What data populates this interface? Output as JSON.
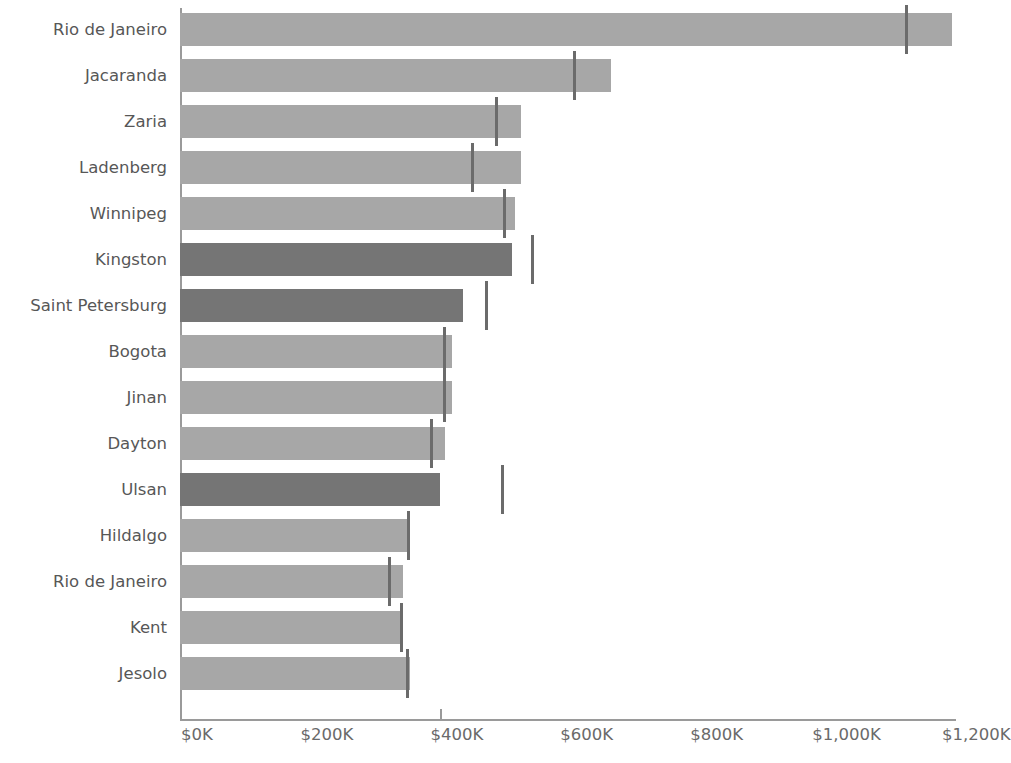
{
  "chart_data": {
    "type": "bar",
    "orientation": "horizontal",
    "title": "",
    "xlabel": "",
    "ylabel": "",
    "xlim": [
      0,
      1250
    ],
    "grid": false,
    "legend": false,
    "value_unit": "K",
    "value_prefix": "$",
    "x_ticks": [
      {
        "label": "$0K",
        "value": 0
      },
      {
        "label": "$200K",
        "value": 200
      },
      {
        "label": "$400K",
        "value": 400
      },
      {
        "label": "$600K",
        "value": 600
      },
      {
        "label": "$800K",
        "value": 800
      },
      {
        "label": "$1,000K",
        "value": 1000
      },
      {
        "label": "$1,200K",
        "value": 1200
      }
    ],
    "categories": [
      "Rio de Janeiro",
      "Jacaranda",
      "Zaria",
      "Ladenberg",
      "Winnipeg",
      "Kingston",
      "Saint Petersburg",
      "Bogota",
      "Jinan",
      "Dayton",
      "Ulsan",
      "Hildalgo",
      "Rio de Janeiro",
      "Kent",
      "Jesolo"
    ],
    "values": [
      1188,
      663,
      525,
      525,
      516,
      511,
      436,
      419,
      419,
      408,
      400,
      351,
      343,
      338,
      354
    ],
    "reference_values": [
      1117,
      605,
      485,
      448,
      497,
      540,
      469,
      405,
      405,
      385,
      494,
      349,
      320,
      338,
      348
    ],
    "series": [
      {
        "name": "Value",
        "values": [
          1188,
          663,
          525,
          525,
          516,
          511,
          436,
          419,
          419,
          408,
          400,
          351,
          343,
          338,
          354
        ]
      },
      {
        "name": "Reference",
        "values": [
          1117,
          605,
          485,
          448,
          497,
          540,
          469,
          405,
          405,
          385,
          494,
          349,
          320,
          338,
          348
        ]
      }
    ],
    "bar_shades": [
      "light",
      "light",
      "light",
      "light",
      "light",
      "dark",
      "dark",
      "light",
      "light",
      "light",
      "dark",
      "light",
      "light",
      "light",
      "light"
    ],
    "colors": {
      "bar_light": "#a7a7a7",
      "bar_dark": "#757575",
      "marker": "#6b6b6b",
      "axis": "#9a9a9a",
      "text": "#575757",
      "background": "#ffffff"
    }
  }
}
